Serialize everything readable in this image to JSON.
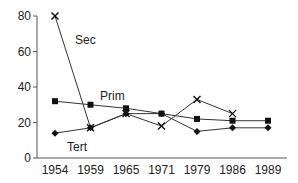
{
  "chart_data": {
    "type": "line",
    "title": "",
    "xlabel": "",
    "ylabel": "",
    "categories": [
      "1954",
      "1959",
      "1965",
      "1971",
      "1979",
      "1986",
      "1989"
    ],
    "ylim": [
      0,
      80
    ],
    "yticks": [
      0,
      20,
      40,
      60,
      80
    ],
    "grid": false,
    "legend": "inline labels",
    "series": [
      {
        "name": "Sec",
        "marker": "x",
        "values": [
          80,
          17,
          25,
          18,
          33,
          25,
          null
        ]
      },
      {
        "name": "Prim",
        "marker": "square",
        "values": [
          32,
          30,
          28,
          25,
          22,
          21,
          21
        ]
      },
      {
        "name": "Tert",
        "marker": "diamond",
        "values": [
          14,
          17,
          25,
          25,
          15,
          17,
          17
        ]
      }
    ],
    "annotations": [
      {
        "text": "Sec",
        "series": "Sec"
      },
      {
        "text": "Prim",
        "series": "Prim"
      },
      {
        "text": "Tert",
        "series": "Tert"
      }
    ]
  }
}
